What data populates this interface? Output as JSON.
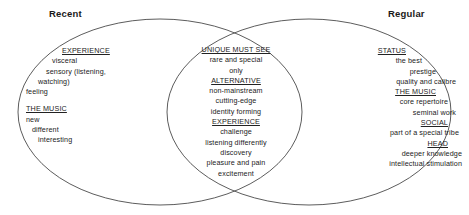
{
  "diagram": {
    "type": "venn",
    "left_title": "Recent",
    "right_title": "Regular",
    "stroke_color": "#4a4a4a",
    "text_color": "#222222",
    "background": "#ffffff",
    "left_region": {
      "groups": [
        {
          "heading": "EXPERIENCE",
          "items": [
            "visceral",
            "sensory (listening,",
            "watching)",
            "feeling"
          ]
        },
        {
          "heading": "THE MUSIC",
          "items": [
            "new",
            "different",
            "interesting"
          ]
        }
      ]
    },
    "center_region": {
      "groups": [
        {
          "heading": "UNIQUE MUST SEE",
          "items": [
            "rare and special",
            "only"
          ]
        },
        {
          "heading": "ALTERNATIVE",
          "items": [
            "non-mainstream",
            "cutting-edge",
            "identity forming"
          ]
        },
        {
          "heading": "EXPERIENCE",
          "items": [
            "challenge",
            "listening differently",
            "discovery",
            "pleasure and pain",
            "excitement"
          ]
        }
      ]
    },
    "right_region": {
      "groups": [
        {
          "heading": "STATUS",
          "items": [
            "the best",
            "prestige",
            "quality and calibre"
          ]
        },
        {
          "heading": "THE MUSIC",
          "items": [
            "core repertoire",
            "seminal work"
          ]
        },
        {
          "heading": "SOCIAL",
          "items": [
            "part of a special tribe"
          ]
        },
        {
          "heading": "HEAD",
          "items": [
            "deeper knowledge",
            "intellectual stimulation"
          ]
        }
      ]
    }
  }
}
